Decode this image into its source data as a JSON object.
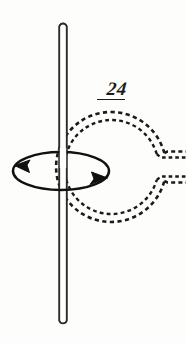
{
  "figure": {
    "label": "24",
    "caption_text": "24",
    "background_color": "#fdfdfc",
    "ink_color": "#1a1a1a",
    "width": 186,
    "height": 343
  },
  "elements": {
    "rod": {
      "name": "vertical rod",
      "orientation": "vertical",
      "x_left": 59,
      "x_right": 67,
      "y_top": 22,
      "y_bottom": 325,
      "style": "outlined cylinder with rounded ends",
      "stroke_color": "#2b2b2b"
    },
    "coil": {
      "name": "dashed circular coil",
      "center_x": 111,
      "center_y": 167,
      "outer_radius": 55,
      "inner_radius": 47,
      "style": "double dashed circle with gap at right",
      "gap_start_deg": -14,
      "gap_end_deg": 14,
      "stroke_color": "#1a1a1a"
    },
    "leads": {
      "name": "coil leads",
      "direction": "right",
      "upper_lead_y": 156,
      "lower_lead_y": 177,
      "end_x": 186,
      "style": "dashed"
    },
    "field_loop": {
      "name": "magnetic field ellipse",
      "center_x": 61,
      "center_y": 171,
      "radius_x": 48,
      "radius_y": 19,
      "style": "solid ellipse with two arrowheads",
      "arrow_left_direction": "left",
      "arrow_right_direction": "right",
      "circulation": "counterclockwise viewed from above",
      "stroke_color": "#111111"
    }
  }
}
